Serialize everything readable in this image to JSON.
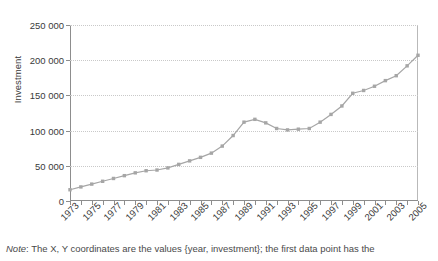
{
  "chart_data": {
    "type": "line",
    "title": "",
    "xlabel": "",
    "ylabel": "Investment",
    "xlim": [
      1973,
      2005
    ],
    "ylim": [
      0,
      250000
    ],
    "yticks": [
      0,
      50000,
      100000,
      150000,
      200000,
      250000
    ],
    "ytick_labels": [
      "0",
      "50 000",
      "100 000",
      "150 000",
      "200 000",
      "250 000"
    ],
    "xtick_labels": [
      "1973",
      "1975",
      "1977",
      "1979",
      "1981",
      "1983",
      "1985",
      "1987",
      "1989",
      "1991",
      "1993",
      "1995",
      "1997",
      "1999",
      "2001",
      "2003",
      "2005"
    ],
    "grid": true,
    "legend": "none",
    "marker": "square",
    "series_color": "#a6a6a6",
    "x": [
      1973,
      1974,
      1975,
      1976,
      1977,
      1978,
      1979,
      1980,
      1981,
      1982,
      1983,
      1984,
      1985,
      1986,
      1987,
      1988,
      1989,
      1990,
      1991,
      1992,
      1993,
      1994,
      1995,
      1996,
      1997,
      1998,
      1999,
      2000,
      2001,
      2002,
      2003,
      2004,
      2005
    ],
    "values": [
      16000,
      20000,
      24000,
      28000,
      32000,
      36000,
      40000,
      43000,
      44000,
      47000,
      52000,
      57000,
      62000,
      68000,
      78000,
      93000,
      112000,
      116000,
      111000,
      103000,
      101000,
      102000,
      103000,
      112000,
      123000,
      135000,
      153000,
      157000,
      163000,
      171000,
      178000,
      192000,
      207000
    ],
    "note_prefix": "Note",
    "note_text": ": The X, Y coordinates are the values {year, investment}; the first data point has the"
  }
}
